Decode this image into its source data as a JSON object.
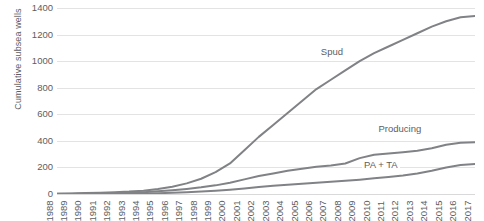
{
  "chart_data": {
    "type": "line",
    "title": "",
    "xlabel": "",
    "ylabel": "Cumulative subsea wells",
    "ylim": [
      0,
      1400
    ],
    "yticks": [
      0,
      200,
      400,
      600,
      800,
      1000,
      1200,
      1400
    ],
    "grid": true,
    "legend_position": "inline-labels",
    "line_color": "#808285",
    "grid_color": "#e3e3e3",
    "categories": [
      "1988",
      "1989",
      "1990",
      "1991",
      "1992",
      "1993",
      "1994",
      "1995",
      "1996",
      "1997",
      "1998",
      "1999",
      "2000",
      "2001",
      "2002",
      "2003",
      "2004",
      "2005",
      "2006",
      "2007",
      "2008",
      "2009",
      "2010",
      "2011",
      "2012",
      "2013",
      "2014",
      "2015",
      "2016",
      "2017"
    ],
    "series": [
      {
        "name": "Spud",
        "values": [
          2,
          4,
          7,
          10,
          14,
          18,
          25,
          38,
          55,
          80,
          115,
          165,
          230,
          330,
          430,
          520,
          610,
          700,
          790,
          860,
          930,
          1000,
          1060,
          1110,
          1160,
          1210,
          1260,
          1300,
          1330,
          1340
        ]
      },
      {
        "name": "Producing",
        "values": [
          1,
          2,
          3,
          5,
          7,
          10,
          14,
          20,
          28,
          38,
          50,
          65,
          85,
          110,
          135,
          155,
          175,
          190,
          205,
          215,
          230,
          270,
          295,
          305,
          315,
          325,
          345,
          370,
          385,
          390
        ]
      },
      {
        "name": "PA + TA",
        "values": [
          0,
          0,
          1,
          1,
          2,
          3,
          4,
          6,
          9,
          13,
          18,
          24,
          32,
          42,
          52,
          62,
          70,
          78,
          85,
          92,
          100,
          108,
          118,
          128,
          140,
          155,
          175,
          200,
          218,
          225
        ]
      }
    ],
    "annotations": [
      {
        "text": "Spud",
        "x_year": "2007",
        "y_value": 1060
      },
      {
        "text": "Producing",
        "x_year": "2011",
        "y_value": 480
      },
      {
        "text": "PA + TA",
        "x_year": "2010",
        "y_value": 210
      }
    ]
  }
}
